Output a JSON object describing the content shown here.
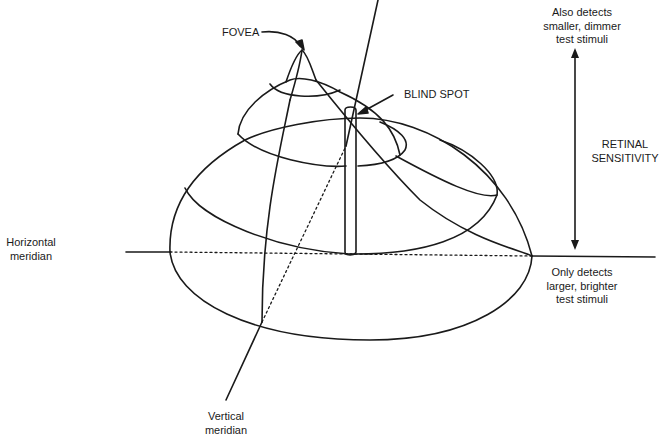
{
  "diagram": {
    "labels": {
      "fovea": "FOVEA",
      "blind_spot": "BLIND SPOT",
      "top_right": "Also detects\nsmaller, dimmer\ntest stimuli",
      "retinal_sensitivity": "RETINAL\nSENSITIVITY",
      "bottom_right": "Only detects\nlarger, brighter\ntest stimuli",
      "horizontal_meridian": "Horizontal\nmeridian",
      "vertical_meridian": "Vertical\nmeridian"
    },
    "colors": {
      "line": "#1a1a1a",
      "background": "#ffffff"
    }
  }
}
